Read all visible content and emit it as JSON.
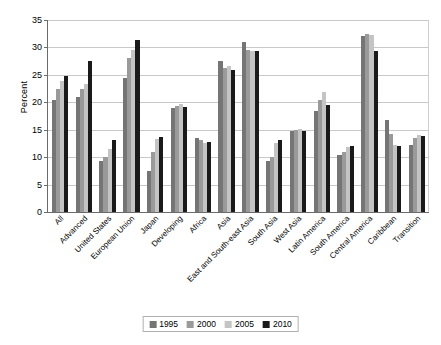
{
  "chart_data": {
    "type": "bar",
    "title": "",
    "xlabel": "",
    "ylabel": "Percent",
    "ylim": [
      0,
      35
    ],
    "yticks": [
      0,
      5,
      10,
      15,
      20,
      25,
      30,
      35
    ],
    "grid": true,
    "legend_position": "bottom",
    "categories": [
      "All",
      "Advanced",
      "United States",
      "European Union",
      "Japan",
      "Developing",
      "Africa",
      "Asia",
      "East and South-east Asia",
      "South Asia",
      "West Asia",
      "Latin America",
      "South America",
      "Central America",
      "Caribbean",
      "Transition"
    ],
    "series": [
      {
        "name": "1995",
        "color": "#757575",
        "values": [
          20.5,
          21.0,
          9.3,
          24.4,
          7.5,
          19.0,
          13.5,
          27.5,
          31.0,
          9.3,
          14.7,
          18.4,
          10.4,
          32.0,
          16.8,
          12.2
        ]
      },
      {
        "name": "2000",
        "color": "#9a9a9a",
        "values": [
          22.5,
          22.5,
          10.0,
          28.0,
          11.0,
          19.3,
          13.2,
          26.3,
          29.5,
          10.1,
          14.9,
          20.5,
          10.9,
          32.5,
          14.3,
          13.5
        ]
      },
      {
        "name": "2005",
        "color": "#c4c4c4",
        "values": [
          23.8,
          23.4,
          11.5,
          29.5,
          13.3,
          19.7,
          12.6,
          26.6,
          29.4,
          12.5,
          15.2,
          21.8,
          11.8,
          32.2,
          12.3,
          14.0
        ]
      },
      {
        "name": "2010",
        "color": "#1a1a1a",
        "values": [
          24.8,
          27.5,
          13.2,
          31.3,
          13.7,
          19.2,
          12.8,
          25.8,
          29.3,
          13.2,
          14.8,
          19.5,
          12.1,
          29.3,
          12.0,
          13.8
        ]
      }
    ]
  },
  "legend": {
    "items": [
      {
        "label": "1995",
        "color": "#757575"
      },
      {
        "label": "2000",
        "color": "#9a9a9a"
      },
      {
        "label": "2005",
        "color": "#c4c4c4"
      },
      {
        "label": "2010",
        "color": "#1a1a1a"
      }
    ]
  }
}
